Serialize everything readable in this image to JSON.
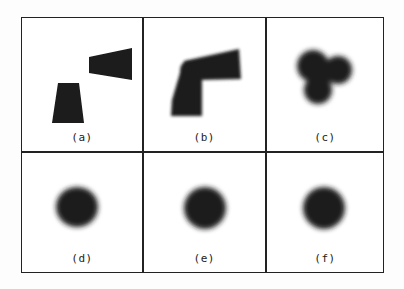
{
  "figure": {
    "layout": "2x3 grid of image panels",
    "panels": [
      {
        "id": "a",
        "label": "(a)",
        "content": "two separated dark trapezoid blocks"
      },
      {
        "id": "b",
        "label": "(b)",
        "content": "blurred L-shaped merged blob"
      },
      {
        "id": "c",
        "label": "(c)",
        "content": "blurred three-lobed blob"
      },
      {
        "id": "d",
        "label": "(d)",
        "content": "blurred round blob"
      },
      {
        "id": "e",
        "label": "(e)",
        "content": "blurred round blob"
      },
      {
        "id": "f",
        "label": "(f)",
        "content": "blurred round blob"
      }
    ],
    "colors": {
      "border": "#222222",
      "shape": "#1a1a1a",
      "background": "#ffffff"
    }
  }
}
